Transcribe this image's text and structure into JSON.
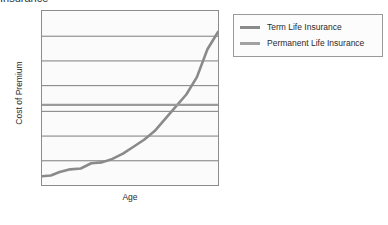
{
  "chart_data": {
    "type": "line",
    "title": "Insurance",
    "xlabel": "Age",
    "ylabel": "Cost of Premium",
    "grid": true,
    "gridlines": 6,
    "xticklabels": [],
    "yticklabels": [],
    "xlim": [
      0,
      100
    ],
    "ylim": [
      0,
      100
    ],
    "legend_position": "upper right outside",
    "series": [
      {
        "name": "Term Life Insurance",
        "color": "#8a8a8a",
        "x": [
          0,
          5,
          10,
          16,
          22,
          28,
          34,
          40,
          46,
          52,
          58,
          64,
          70,
          76,
          82,
          88,
          94,
          100
        ],
        "y": [
          5,
          5.5,
          7.5,
          9,
          9.5,
          12.5,
          13,
          15,
          18,
          22,
          26,
          31,
          38,
          45,
          52,
          62,
          78,
          88
        ]
      },
      {
        "name": "Permanent Life Insurance",
        "color": "#9b9b9b",
        "x": [
          0,
          100
        ],
        "y": [
          46,
          46
        ]
      }
    ]
  },
  "legend": {
    "items": [
      {
        "label": "Term Life Insurance",
        "color": "#8a8a8a"
      },
      {
        "label": "Permanent Life Insurance",
        "color": "#a2a2a2"
      }
    ]
  }
}
